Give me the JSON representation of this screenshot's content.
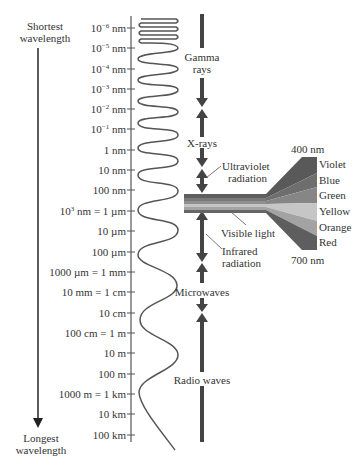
{
  "diagram": {
    "left_arrow": {
      "top_label_line1": "Shortest",
      "top_label_line2": "wavelength",
      "bottom_label_line1": "Longest",
      "bottom_label_line2": "wavelength"
    },
    "scale_ticks": [
      {
        "base": "10",
        "exp": "−6",
        "unit": " nm",
        "y": 28
      },
      {
        "base": "10",
        "exp": "−5",
        "unit": " nm",
        "y": 48
      },
      {
        "base": "10",
        "exp": "−4",
        "unit": " nm",
        "y": 69
      },
      {
        "base": "10",
        "exp": "−3",
        "unit": " nm",
        "y": 89
      },
      {
        "base": "10",
        "exp": "−2",
        "unit": " nm",
        "y": 109
      },
      {
        "base": "10",
        "exp": "−1",
        "unit": " nm",
        "y": 129
      },
      {
        "text": "1 nm",
        "y": 150
      },
      {
        "text": "10 nm",
        "y": 170
      },
      {
        "text": "100 nm",
        "y": 190
      },
      {
        "base": "10",
        "exp": "3",
        "unit": " nm = 1 µm",
        "y": 211
      },
      {
        "text": "10 µm",
        "y": 231
      },
      {
        "text": "100 µm",
        "y": 252
      },
      {
        "text": "1000 µm = 1 mm",
        "y": 272
      },
      {
        "text": "10 mm = 1 cm",
        "y": 292
      },
      {
        "text": "10 cm",
        "y": 313
      },
      {
        "text": "100 cm = 1 m",
        "y": 333
      },
      {
        "text": "10 m",
        "y": 353
      },
      {
        "text": "100 m",
        "y": 374
      },
      {
        "text": "1000 m = 1 km",
        "y": 394
      },
      {
        "text": "10 km",
        "y": 414
      },
      {
        "text": "100 km",
        "y": 435
      }
    ],
    "regions": {
      "gamma_line1": "Gamma",
      "gamma_line2": "rays",
      "xrays": "X-rays",
      "uv_line1": "Ultraviolet",
      "uv_line2": "radiation",
      "visible": "Visible light",
      "ir_line1": "Infrared",
      "ir_line2": "radiation",
      "microwaves": "Microwaves",
      "radio": "Radio waves"
    },
    "visible_spectrum": {
      "top_wavelength": "400 nm",
      "bottom_wavelength": "700 nm",
      "colors": [
        {
          "name": "Violet",
          "shade": "#5a5a5a"
        },
        {
          "name": "Blue",
          "shade": "#6e6e6e"
        },
        {
          "name": "Green",
          "shade": "#858585"
        },
        {
          "name": "Yellow",
          "shade": "#c4c4c4"
        },
        {
          "name": "Orange",
          "shade": "#a3a3a3"
        },
        {
          "name": "Red",
          "shade": "#5e5e5e"
        }
      ]
    },
    "colors": {
      "ink": "#333333",
      "arrow": "#444444",
      "axis": "#555555"
    }
  }
}
